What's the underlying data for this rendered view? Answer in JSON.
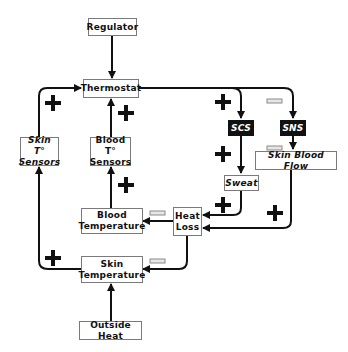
{
  "diagram": {
    "nodes": {
      "regulator": "Regulator",
      "thermostat": "Thermostat",
      "skin_sensors_line1": "Skin T°",
      "skin_sensors_line2": "Sensors",
      "blood_sensors_line1": "Blood T°",
      "blood_sensors_line2": "Sensors",
      "scs": "SCS",
      "sns": "SNS",
      "skin_blood_flow": "Skin Blood Flow",
      "sweat": "Sweat",
      "heat_loss_line1": "Heat",
      "heat_loss_line2": "Loss",
      "blood_temp_line1": "Blood",
      "blood_temp_line2": "Temperature",
      "skin_temp_line1": "Skin",
      "skin_temp_line2": "Temperature",
      "outside_heat": "Outside Heat"
    },
    "edges": [
      {
        "from": "Regulator",
        "to": "Thermostat",
        "sign": ""
      },
      {
        "from": "Skin T° Sensors",
        "to": "Thermostat",
        "sign": "+"
      },
      {
        "from": "Blood T° Sensors",
        "to": "Thermostat",
        "sign": "+"
      },
      {
        "from": "Thermostat",
        "to": "SCS",
        "sign": "+"
      },
      {
        "from": "Thermostat",
        "to": "SNS",
        "sign": "-"
      },
      {
        "from": "SCS",
        "to": "Sweat",
        "sign": "+"
      },
      {
        "from": "SNS",
        "to": "Skin Blood Flow",
        "sign": "-"
      },
      {
        "from": "Sweat",
        "to": "Heat Loss",
        "sign": "+"
      },
      {
        "from": "Skin Blood Flow",
        "to": "Heat Loss",
        "sign": "+"
      },
      {
        "from": "Heat Loss",
        "to": "Blood Temperature",
        "sign": "-"
      },
      {
        "from": "Heat Loss",
        "to": "Skin Temperature",
        "sign": "-"
      },
      {
        "from": "Blood Temperature",
        "to": "Blood T° Sensors",
        "sign": "+"
      },
      {
        "from": "Skin Temperature",
        "to": "Skin T° Sensors",
        "sign": "+"
      },
      {
        "from": "Outside Heat",
        "to": "Skin Temperature",
        "sign": ""
      }
    ],
    "colors": {
      "line": "#111111",
      "box_border": "#7a7a7a",
      "dark_box": "#111111",
      "minus_sign": "#9a9a9a"
    }
  }
}
